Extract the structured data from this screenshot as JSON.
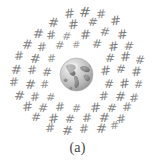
{
  "figure": {
    "caption": "(a)",
    "background_color": "#ffffff"
  },
  "globe": {
    "name": "earth-globe",
    "description": "grayscale Earth globe showing the Americas",
    "ocean_color": "#c9c9c9",
    "land_color": "#8a8a8a",
    "highlight_color": "#ebebeb",
    "shadow_color": "#9a9a9a",
    "outline_color": "#b0b0b0",
    "center": {
      "x": 76,
      "y": 74
    },
    "diameter": 35
  },
  "hash_cloud": {
    "symbol": "#",
    "color": "#6b6b6b",
    "count": 62,
    "symbols": [
      {
        "x": 64,
        "y": 7,
        "size": 13,
        "rot": -6,
        "opacity": 0.82
      },
      {
        "x": 79,
        "y": 5,
        "size": 14,
        "rot": 4,
        "opacity": 0.9
      },
      {
        "x": 96,
        "y": 8,
        "size": 12,
        "rot": -3,
        "opacity": 0.78
      },
      {
        "x": 48,
        "y": 16,
        "size": 13,
        "rot": 5,
        "opacity": 0.85
      },
      {
        "x": 68,
        "y": 18,
        "size": 13,
        "rot": -4,
        "opacity": 0.88
      },
      {
        "x": 88,
        "y": 16,
        "size": 12,
        "rot": 6,
        "opacity": 0.8
      },
      {
        "x": 110,
        "y": 14,
        "size": 13,
        "rot": -5,
        "opacity": 0.86
      },
      {
        "x": 33,
        "y": 27,
        "size": 13,
        "rot": 3,
        "opacity": 0.84
      },
      {
        "x": 46,
        "y": 29,
        "size": 12,
        "rot": -6,
        "opacity": 0.8
      },
      {
        "x": 62,
        "y": 31,
        "size": 11,
        "rot": 5,
        "opacity": 0.7
      },
      {
        "x": 80,
        "y": 28,
        "size": 13,
        "rot": -2,
        "opacity": 0.87
      },
      {
        "x": 100,
        "y": 26,
        "size": 12,
        "rot": 7,
        "opacity": 0.79
      },
      {
        "x": 117,
        "y": 28,
        "size": 13,
        "rot": -4,
        "opacity": 0.85
      },
      {
        "x": 22,
        "y": 38,
        "size": 13,
        "rot": 4,
        "opacity": 0.83
      },
      {
        "x": 37,
        "y": 41,
        "size": 12,
        "rot": -5,
        "opacity": 0.78
      },
      {
        "x": 55,
        "y": 40,
        "size": 11,
        "rot": 6,
        "opacity": 0.72
      },
      {
        "x": 72,
        "y": 40,
        "size": 10,
        "rot": -3,
        "opacity": 0.65
      },
      {
        "x": 92,
        "y": 38,
        "size": 12,
        "rot": 5,
        "opacity": 0.8
      },
      {
        "x": 108,
        "y": 40,
        "size": 13,
        "rot": -6,
        "opacity": 0.86
      },
      {
        "x": 124,
        "y": 40,
        "size": 12,
        "rot": 3,
        "opacity": 0.8
      },
      {
        "x": 14,
        "y": 50,
        "size": 12,
        "rot": -4,
        "opacity": 0.8
      },
      {
        "x": 30,
        "y": 52,
        "size": 13,
        "rot": 6,
        "opacity": 0.85
      },
      {
        "x": 47,
        "y": 53,
        "size": 11,
        "rot": -5,
        "opacity": 0.72
      },
      {
        "x": 105,
        "y": 52,
        "size": 12,
        "rot": 4,
        "opacity": 0.82
      },
      {
        "x": 120,
        "y": 50,
        "size": 13,
        "rot": -3,
        "opacity": 0.86
      },
      {
        "x": 135,
        "y": 54,
        "size": 12,
        "rot": 5,
        "opacity": 0.78
      },
      {
        "x": 11,
        "y": 63,
        "size": 13,
        "rot": 3,
        "opacity": 0.84
      },
      {
        "x": 27,
        "y": 64,
        "size": 12,
        "rot": -6,
        "opacity": 0.79
      },
      {
        "x": 42,
        "y": 66,
        "size": 12,
        "rot": 4,
        "opacity": 0.8
      },
      {
        "x": 100,
        "y": 64,
        "size": 13,
        "rot": -5,
        "opacity": 0.85
      },
      {
        "x": 116,
        "y": 63,
        "size": 12,
        "rot": 6,
        "opacity": 0.8
      },
      {
        "x": 131,
        "y": 65,
        "size": 13,
        "rot": -2,
        "opacity": 0.84
      },
      {
        "x": 9,
        "y": 76,
        "size": 12,
        "rot": -5,
        "opacity": 0.8
      },
      {
        "x": 25,
        "y": 78,
        "size": 13,
        "rot": 4,
        "opacity": 0.85
      },
      {
        "x": 40,
        "y": 79,
        "size": 11,
        "rot": -3,
        "opacity": 0.74
      },
      {
        "x": 104,
        "y": 78,
        "size": 12,
        "rot": 5,
        "opacity": 0.82
      },
      {
        "x": 119,
        "y": 77,
        "size": 13,
        "rot": -6,
        "opacity": 0.85
      },
      {
        "x": 134,
        "y": 79,
        "size": 11,
        "rot": 3,
        "opacity": 0.74
      },
      {
        "x": 14,
        "y": 89,
        "size": 13,
        "rot": 5,
        "opacity": 0.84
      },
      {
        "x": 30,
        "y": 91,
        "size": 12,
        "rot": -4,
        "opacity": 0.79
      },
      {
        "x": 46,
        "y": 92,
        "size": 11,
        "rot": 6,
        "opacity": 0.72
      },
      {
        "x": 99,
        "y": 90,
        "size": 12,
        "rot": -5,
        "opacity": 0.82
      },
      {
        "x": 115,
        "y": 90,
        "size": 13,
        "rot": 4,
        "opacity": 0.85
      },
      {
        "x": 129,
        "y": 92,
        "size": 12,
        "rot": -3,
        "opacity": 0.78
      },
      {
        "x": 22,
        "y": 100,
        "size": 13,
        "rot": -6,
        "opacity": 0.84
      },
      {
        "x": 38,
        "y": 102,
        "size": 12,
        "rot": 5,
        "opacity": 0.8
      },
      {
        "x": 55,
        "y": 101,
        "size": 12,
        "rot": -4,
        "opacity": 0.79
      },
      {
        "x": 72,
        "y": 103,
        "size": 11,
        "rot": 3,
        "opacity": 0.73
      },
      {
        "x": 90,
        "y": 101,
        "size": 13,
        "rot": -5,
        "opacity": 0.84
      },
      {
        "x": 107,
        "y": 102,
        "size": 12,
        "rot": 6,
        "opacity": 0.8
      },
      {
        "x": 122,
        "y": 101,
        "size": 12,
        "rot": -3,
        "opacity": 0.79
      },
      {
        "x": 31,
        "y": 111,
        "size": 12,
        "rot": 4,
        "opacity": 0.8
      },
      {
        "x": 48,
        "y": 112,
        "size": 13,
        "rot": -5,
        "opacity": 0.84
      },
      {
        "x": 65,
        "y": 113,
        "size": 12,
        "rot": 6,
        "opacity": 0.79
      },
      {
        "x": 82,
        "y": 112,
        "size": 12,
        "rot": -4,
        "opacity": 0.8
      },
      {
        "x": 99,
        "y": 111,
        "size": 13,
        "rot": 3,
        "opacity": 0.84
      },
      {
        "x": 116,
        "y": 113,
        "size": 12,
        "rot": -6,
        "opacity": 0.78
      },
      {
        "x": 45,
        "y": 122,
        "size": 12,
        "rot": -3,
        "opacity": 0.79
      },
      {
        "x": 62,
        "y": 124,
        "size": 13,
        "rot": 5,
        "opacity": 0.84
      },
      {
        "x": 79,
        "y": 123,
        "size": 12,
        "rot": -4,
        "opacity": 0.8
      },
      {
        "x": 96,
        "y": 122,
        "size": 13,
        "rot": 4,
        "opacity": 0.83
      },
      {
        "x": 110,
        "y": 120,
        "size": 11,
        "rot": -5,
        "opacity": 0.72
      }
    ]
  }
}
